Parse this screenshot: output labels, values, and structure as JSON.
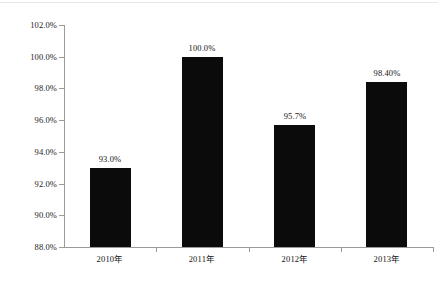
{
  "chart_data": {
    "type": "bar",
    "title": "",
    "subtitle": "",
    "xlabel": "",
    "ylabel": "",
    "categories": [
      "2010年",
      "2011年",
      "2012年",
      "2013年"
    ],
    "values": [
      93.0,
      100.0,
      95.7,
      98.4
    ],
    "value_labels": [
      "93.0%",
      "100.0%",
      "95.7%",
      "98.40%"
    ],
    "ylim": [
      88.0,
      102.0
    ],
    "ytick_values": [
      102.0,
      100.0,
      98.0,
      96.0,
      94.0,
      92.0,
      90.0,
      88.0
    ],
    "ytick_labels": [
      "102.0%",
      "100.0%",
      "98.0%",
      "96.0%",
      "94.0%",
      "92.0%",
      "90.0%",
      "88.0%"
    ],
    "grid": false,
    "legend": null,
    "legend_position": "none",
    "series": [
      {
        "name": "",
        "values": [
          93.0,
          100.0,
          95.7,
          98.4
        ],
        "color": "#0b0b0b"
      }
    ],
    "annotations": []
  },
  "style": {
    "bar_color": "#0b0b0b",
    "axis_color": "#9a9a9a",
    "text_color": "#151515",
    "background": "#ffffff"
  }
}
